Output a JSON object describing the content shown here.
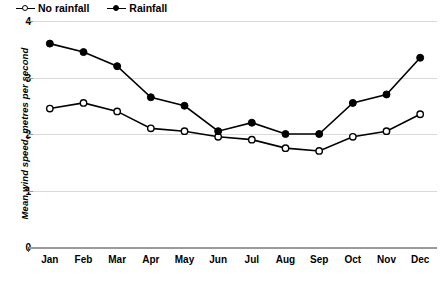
{
  "chart_data": {
    "type": "line",
    "title": "",
    "xlabel": "",
    "ylabel": "Mean wind speed, metres per second",
    "categories": [
      "Jan",
      "Feb",
      "Mar",
      "Apr",
      "May",
      "Jun",
      "Jul",
      "Aug",
      "Sep",
      "Oct",
      "Nov",
      "Dec"
    ],
    "ylim": [
      0,
      4
    ],
    "yticks": [
      "0",
      "1",
      "2",
      "3",
      "4"
    ],
    "ytick_values": [
      0,
      1,
      2,
      3,
      4
    ],
    "grid": true,
    "legend_position": "top-left",
    "series": [
      {
        "name": "No rainfall",
        "marker": "open-circle",
        "color": "#000000",
        "values": [
          2.45,
          2.55,
          2.4,
          2.1,
          2.05,
          1.95,
          1.9,
          1.75,
          1.7,
          1.95,
          2.05,
          2.35
        ]
      },
      {
        "name": "Rainfall",
        "marker": "filled-circle",
        "color": "#000000",
        "values": [
          3.6,
          3.45,
          3.2,
          2.65,
          2.5,
          2.05,
          2.2,
          2.0,
          2.0,
          2.55,
          2.7,
          3.35
        ]
      }
    ]
  },
  "legend": {
    "entries": [
      {
        "label": "No rainfall"
      },
      {
        "label": "Rainfall"
      }
    ]
  },
  "axes": {
    "y_title": "Mean wind speed, metres per second"
  }
}
